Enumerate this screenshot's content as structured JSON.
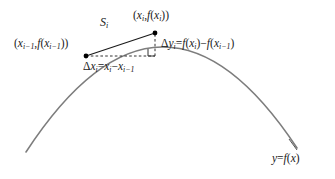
{
  "figure": {
    "type": "geometry-diagram",
    "background_color": "#ffffff"
  },
  "colors": {
    "curve": "#7d7d7d",
    "chord": "#1a1a1a",
    "dashed": "#333333",
    "text": "#1a1a1a",
    "point": "#000000"
  },
  "labels": {
    "left_point": {
      "text": "(x_{i-1}, f(x_{i-1}))",
      "parts": {
        "open": "(",
        "x": "x",
        "xsub": "i−1",
        "comma": ",",
        "f": "f",
        "fopen": "(",
        "fx": "x",
        "fxsub": "i−1",
        "close": "))"
      }
    },
    "top_point": {
      "text": "(x_i, f(x_i))",
      "parts": {
        "open": "(",
        "x": "x",
        "xsub": "i",
        "comma": ",",
        "f": "f",
        "fopen": "(",
        "fx": "x",
        "fxsub": "i",
        "close": "))"
      }
    },
    "secant": {
      "text": "S_i",
      "parts": {
        "sym": "S",
        "sub": "i"
      }
    },
    "delta_y": {
      "text": "Δy_i = f(x_i) − f(x_{i-1})",
      "parts": {
        "delta": "Δ",
        "y": "y",
        "ysub": "i",
        "eq": "=",
        "f1": "f",
        "o1": "(",
        "x1": "x",
        "x1sub": "i",
        "c1": ")",
        "minus": "−",
        "f2": "f",
        "o2": "(",
        "x2": "x",
        "x2sub": "i−1",
        "c2": ")"
      }
    },
    "delta_x": {
      "text": "Δx_i = x_i − x_{i-1}",
      "parts": {
        "delta": "Δ",
        "x": "x",
        "xsub": "i",
        "eq": "=",
        "x1": "x",
        "x1sub": "i",
        "minus": "−",
        "x2": "x",
        "x2sub": "i−1"
      }
    },
    "curve_equation": {
      "text": "y = f(x)",
      "parts": {
        "y": "y",
        "eq": "=",
        "f": "f",
        "o": "(",
        "x": "x",
        "c": ")"
      }
    }
  },
  "geometry": {
    "curve": {
      "description": "downward-opening concave arc",
      "start": [
        26,
        152
      ],
      "control": [
        162,
        -56
      ],
      "end": [
        297,
        148
      ]
    },
    "points": [
      {
        "name": "left-point",
        "x": 86,
        "y": 56
      },
      {
        "name": "top-point",
        "x": 155,
        "y": 33
      }
    ],
    "corner_vertex": {
      "x": 155,
      "y": 56
    },
    "right_angle_marker": {
      "x": 148,
      "y": 49,
      "size": 7
    },
    "chord": {
      "from": [
        86,
        56
      ],
      "to": [
        155,
        33
      ]
    },
    "leader_line": {
      "from": [
        289,
        140
      ],
      "to": [
        297,
        150
      ]
    }
  }
}
